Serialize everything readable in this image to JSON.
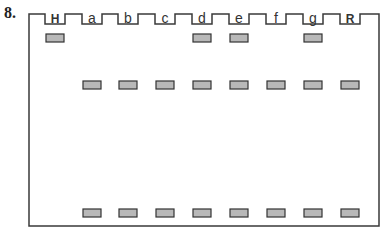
{
  "figure": {
    "number": "8.",
    "lanes": [
      {
        "label": "H",
        "bold": true
      },
      {
        "label": "a",
        "bold": false
      },
      {
        "label": "b",
        "bold": false
      },
      {
        "label": "c",
        "bold": false
      },
      {
        "label": "d",
        "bold": false
      },
      {
        "label": "e",
        "bold": false
      },
      {
        "label": "f",
        "bold": false
      },
      {
        "label": "g",
        "bold": false
      },
      {
        "label": "R",
        "bold": true
      }
    ],
    "bands": {
      "top_row": [
        "H",
        "d",
        "e",
        "g"
      ],
      "middle_row": [
        "a",
        "b",
        "c",
        "d",
        "e",
        "f",
        "g",
        "R"
      ],
      "bottom_row": [
        "a",
        "b",
        "c",
        "d",
        "e",
        "f",
        "g",
        "R"
      ]
    },
    "colors": {
      "outline": "#3a3a3a",
      "band_fill": "#b8b8b8",
      "band_stroke": "#333333"
    }
  }
}
